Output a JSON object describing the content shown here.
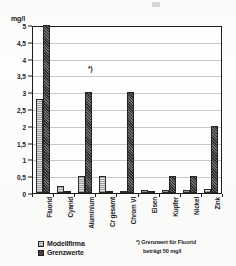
{
  "chart_data": {
    "type": "bar",
    "title": "",
    "subtitle": "",
    "xlabel": "",
    "ylabel": "mg/l",
    "ylim": [
      0,
      5
    ],
    "ytick_step": 0.5,
    "grid": true,
    "legend_position": "bottom-left",
    "categories": [
      "Fluorid",
      "Cyanid",
      "Aluminium",
      "Cr gesamt",
      "Chrom VI",
      "Eisen",
      "Kupfer",
      "Nickel",
      "Zink"
    ],
    "ytick_labels": [
      "5",
      "4,5",
      "4",
      "3,5",
      "3",
      "2,5",
      "2",
      "1,5",
      "1",
      "0,5",
      "0"
    ],
    "ytick_values": [
      5,
      4.5,
      4,
      3.5,
      3,
      2.5,
      2,
      1.5,
      1,
      0.5,
      0
    ],
    "series": [
      {
        "name": "Modellfirma",
        "fill": "light-hatched",
        "values": [
          2.8,
          0.2,
          0.5,
          0.5,
          0.05,
          0.08,
          0.1,
          0.08,
          0.12
        ]
      },
      {
        "name": "Grenzwerte",
        "fill": "dark-dithered",
        "values": [
          5.0,
          0.02,
          3.0,
          0.02,
          3.0,
          0.02,
          0.5,
          0.5,
          2.0
        ],
        "clipped": [
          true,
          false,
          false,
          false,
          false,
          false,
          false,
          false,
          false
        ],
        "actual_values": [
          50,
          0.02,
          3.0,
          0.02,
          3.0,
          0.02,
          0.5,
          0.5,
          2.0
        ]
      }
    ],
    "annotations": [
      {
        "marker": "*)",
        "target": "Fluorid",
        "placement": "inside-plot-top-left"
      }
    ]
  },
  "axis": {
    "unit_label": "mg/l"
  },
  "legend": {
    "items": [
      {
        "label": "Modellfirma"
      },
      {
        "label": "Grenzwerte"
      }
    ]
  },
  "footnote": {
    "line1": "*) Grenzwert für Fluorid",
    "line2": "beträgt 50 mg/l"
  },
  "colors": {
    "axis": "#1d1d1d",
    "grid": "#c9c9c9",
    "series_model": "#9d9d9d",
    "series_limit": "#3a3a3a",
    "background": "#fdfdfc"
  }
}
